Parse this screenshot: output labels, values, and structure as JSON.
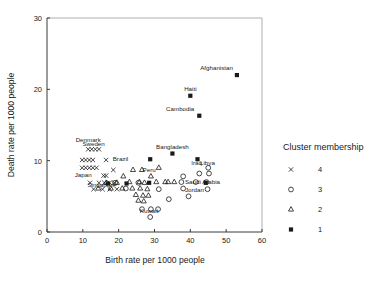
{
  "chart_data": {
    "type": "scatter",
    "title": "",
    "xlabel": "Birth rate per 1000 people",
    "ylabel": "Death rate per 1000 people",
    "xlim": [
      0,
      60
    ],
    "ylim": [
      0,
      30
    ],
    "xticks": [
      "0",
      "10",
      "20",
      "30",
      "40",
      "50",
      "60"
    ],
    "yticks": [
      "0",
      "10",
      "20",
      "30"
    ],
    "grid": false,
    "legend_position": "right",
    "legend": {
      "title": "Cluster membership",
      "entries": [
        {
          "marker": "x-marker",
          "label": "4"
        },
        {
          "marker": "circle-marker",
          "label": "3"
        },
        {
          "marker": "triangle-marker",
          "label": "2"
        },
        {
          "marker": "square-marker",
          "label": "1"
        }
      ]
    },
    "series": [
      {
        "name": "1",
        "marker": "square-marker",
        "points": [
          {
            "x": 53.0,
            "y": 22.0,
            "label": "Afghanistan"
          },
          {
            "x": 40.0,
            "y": 19.1,
            "label": "Haiti"
          },
          {
            "x": 42.5,
            "y": 16.3,
            "label": "Cambodia"
          },
          {
            "x": 35.0,
            "y": 11.0,
            "label": "Bangladesh"
          },
          {
            "x": 28.8,
            "y": 10.2,
            "label": ""
          },
          {
            "x": 42.0,
            "y": 10.2,
            "label": ""
          },
          {
            "x": 28.5,
            "y": 6.9,
            "label": ""
          },
          {
            "x": 22.2,
            "y": 6.8,
            "label": ""
          },
          {
            "x": 17.0,
            "y": 6.8,
            "label": ""
          },
          {
            "x": 44.3,
            "y": 6.9,
            "label": ""
          }
        ]
      },
      {
        "name": "2",
        "marker": "triangle-marker",
        "points": [
          {
            "x": 31.2,
            "y": 9.0,
            "label": ""
          },
          {
            "x": 24.0,
            "y": 8.7,
            "label": ""
          },
          {
            "x": 26.5,
            "y": 8.7,
            "label": ""
          },
          {
            "x": 29.0,
            "y": 7.8,
            "label": "Peru"
          },
          {
            "x": 21.3,
            "y": 7.8,
            "label": ""
          },
          {
            "x": 33.8,
            "y": 7.0,
            "label": ""
          },
          {
            "x": 23.0,
            "y": 7.0,
            "label": ""
          },
          {
            "x": 25.8,
            "y": 7.0,
            "label": ""
          },
          {
            "x": 30.5,
            "y": 7.0,
            "label": ""
          },
          {
            "x": 35.5,
            "y": 7.0,
            "label": ""
          },
          {
            "x": 16.5,
            "y": 6.9,
            "label": ""
          },
          {
            "x": 19.5,
            "y": 6.9,
            "label": ""
          },
          {
            "x": 27.2,
            "y": 6.9,
            "label": ""
          },
          {
            "x": 14.3,
            "y": 6.1,
            "label": ""
          },
          {
            "x": 17.8,
            "y": 6.1,
            "label": ""
          },
          {
            "x": 21.0,
            "y": 6.1,
            "label": ""
          },
          {
            "x": 23.8,
            "y": 6.1,
            "label": ""
          },
          {
            "x": 26.0,
            "y": 6.1,
            "label": ""
          },
          {
            "x": 28.0,
            "y": 6.0,
            "label": ""
          },
          {
            "x": 24.8,
            "y": 5.2,
            "label": ""
          },
          {
            "x": 26.8,
            "y": 5.1,
            "label": ""
          },
          {
            "x": 28.3,
            "y": 5.1,
            "label": ""
          },
          {
            "x": 25.5,
            "y": 4.4,
            "label": ""
          },
          {
            "x": 27.0,
            "y": 4.3,
            "label": ""
          },
          {
            "x": 33.0,
            "y": 7.0,
            "label": ""
          }
        ]
      },
      {
        "name": "3",
        "marker": "circle-marker",
        "points": [
          {
            "x": 45.0,
            "y": 9.0,
            "label": "Libya"
          },
          {
            "x": 42.5,
            "y": 8.2,
            "label": "Iraq"
          },
          {
            "x": 45.2,
            "y": 8.2,
            "label": ""
          },
          {
            "x": 38.0,
            "y": 7.8,
            "label": ""
          },
          {
            "x": 37.5,
            "y": 7.0,
            "label": "Saudi Arabia"
          },
          {
            "x": 41.5,
            "y": 7.0,
            "label": ""
          },
          {
            "x": 44.5,
            "y": 7.0,
            "label": ""
          },
          {
            "x": 38.0,
            "y": 6.1,
            "label": "Jordan"
          },
          {
            "x": 44.8,
            "y": 6.0,
            "label": ""
          },
          {
            "x": 34.0,
            "y": 4.6,
            "label": ""
          },
          {
            "x": 39.5,
            "y": 5.0,
            "label": ""
          },
          {
            "x": 31.2,
            "y": 6.0,
            "label": ""
          },
          {
            "x": 29.0,
            "y": 3.2,
            "label": "Kuwait"
          },
          {
            "x": 28.8,
            "y": 2.1,
            "label": ""
          },
          {
            "x": 31.0,
            "y": 3.2,
            "label": ""
          },
          {
            "x": 26.5,
            "y": 3.2,
            "label": ""
          },
          {
            "x": 22.0,
            "y": 6.1,
            "label": ""
          },
          {
            "x": 19.0,
            "y": 6.9,
            "label": ""
          },
          {
            "x": 25.5,
            "y": 6.9,
            "label": ""
          }
        ]
      },
      {
        "name": "4",
        "marker": "x-marker",
        "points": [
          {
            "x": 11.5,
            "y": 11.6,
            "label": "Denmark"
          },
          {
            "x": 12.5,
            "y": 11.6,
            "label": "Sweden"
          },
          {
            "x": 13.5,
            "y": 11.6,
            "label": ""
          },
          {
            "x": 14.5,
            "y": 11.6,
            "label": ""
          },
          {
            "x": 9.8,
            "y": 10.1,
            "label": ""
          },
          {
            "x": 10.8,
            "y": 10.1,
            "label": ""
          },
          {
            "x": 11.8,
            "y": 10.1,
            "label": ""
          },
          {
            "x": 12.8,
            "y": 10.1,
            "label": ""
          },
          {
            "x": 16.5,
            "y": 10.1,
            "label": "Brazil"
          },
          {
            "x": 9.8,
            "y": 9.0,
            "label": ""
          },
          {
            "x": 10.8,
            "y": 9.0,
            "label": ""
          },
          {
            "x": 11.8,
            "y": 9.0,
            "label": ""
          },
          {
            "x": 12.8,
            "y": 9.0,
            "label": ""
          },
          {
            "x": 13.8,
            "y": 9.0,
            "label": ""
          },
          {
            "x": 18.5,
            "y": 8.7,
            "label": ""
          },
          {
            "x": 15.8,
            "y": 7.9,
            "label": "Japan"
          },
          {
            "x": 16.5,
            "y": 7.9,
            "label": ""
          },
          {
            "x": 12.0,
            "y": 6.9,
            "label": ""
          },
          {
            "x": 14.5,
            "y": 6.9,
            "label": "Singapore"
          },
          {
            "x": 16.0,
            "y": 6.9,
            "label": ""
          },
          {
            "x": 17.5,
            "y": 6.9,
            "label": ""
          },
          {
            "x": 18.8,
            "y": 6.9,
            "label": ""
          },
          {
            "x": 13.0,
            "y": 6.0,
            "label": ""
          },
          {
            "x": 15.5,
            "y": 6.0,
            "label": ""
          },
          {
            "x": 17.5,
            "y": 6.0,
            "label": ""
          },
          {
            "x": 19.5,
            "y": 6.0,
            "label": ""
          }
        ]
      }
    ],
    "annotations": [
      {
        "text": "Afghanistan",
        "x": 53.0,
        "y": 22.0
      },
      {
        "text": "Haiti",
        "x": 40.0,
        "y": 19.1
      },
      {
        "text": "Cambodia",
        "x": 42.5,
        "y": 16.3
      },
      {
        "text": "Bangladesh",
        "x": 35.0,
        "y": 11.0
      },
      {
        "text": "Denmark",
        "x": 11.5,
        "y": 12.4
      },
      {
        "text": "Sweden",
        "x": 13.0,
        "y": 11.8
      },
      {
        "text": "Brazil",
        "x": 17.5,
        "y": 10.1
      },
      {
        "text": "Japan",
        "x": 13.0,
        "y": 7.9
      },
      {
        "text": "Singapore",
        "x": 15.5,
        "y": 6.9
      },
      {
        "text": "Peru",
        "x": 28.5,
        "y": 8.0
      },
      {
        "text": "Iraq",
        "x": 42.0,
        "y": 9.0
      },
      {
        "text": "Libya",
        "x": 44.5,
        "y": 9.0
      },
      {
        "text": "Saudi Arabia",
        "x": 38.5,
        "y": 7.0
      },
      {
        "text": "Jordan",
        "x": 38.5,
        "y": 6.1
      },
      {
        "text": "Kuwait",
        "x": 28.5,
        "y": 3.2
      }
    ]
  }
}
